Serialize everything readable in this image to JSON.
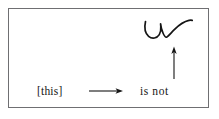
{
  "figure": {
    "caption_text_left": "[this]",
    "caption_text_right": "is not",
    "frame": {
      "border_color": "#6f6f72",
      "background_color": "#ffffff"
    },
    "ink_color": "#151515",
    "page_background": "#ffffff",
    "elements": {
      "horizontal_arrow_name": "rightward arrow",
      "vertical_arrow_name": "upward arrow",
      "squiggle_name": "handwritten check mark"
    }
  }
}
